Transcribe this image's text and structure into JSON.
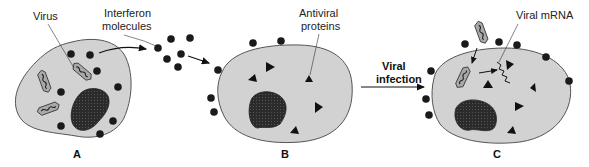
{
  "figure": {
    "type": "interferon-mechanism-diagram",
    "colors": {
      "cytoplasm": "#d2d2d2",
      "membrane": "#555555",
      "nucleus": "#2a2a2a",
      "molecule": "#1a1a1a",
      "virus_fill": "#a9a9a9"
    }
  },
  "labels": {
    "virus": "Virus",
    "interferon_line1": "Interferon",
    "interferon_line2": "molecules",
    "antiviral_line1": "Antiviral",
    "antiviral_line2": "proteins",
    "viral_infection_line1": "Viral",
    "viral_infection_line2": "infection",
    "viral_mrna": "Viral mRNA"
  },
  "panels": [
    {
      "id": "A",
      "label": "A",
      "description": "Virus-infected cell producing interferon molecules"
    },
    {
      "id": "B",
      "label": "B",
      "description": "Neighboring cell bound by interferon producing antiviral proteins"
    },
    {
      "id": "C",
      "label": "C",
      "description": "Viral infection blocked; viral mRNA degraded by antiviral proteins"
    }
  ]
}
